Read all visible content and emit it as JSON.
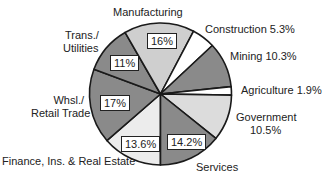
{
  "chart_data": {
    "type": "pie",
    "title": "",
    "start_angle_deg_clockwise_from_top": 180,
    "slices": [
      {
        "label": "Finance, Ins. & Real Estate",
        "value": 13.6,
        "display": "13.6%",
        "fill": "#ececec",
        "label_inside": true
      },
      {
        "label": "Whsl./ Retail Trade",
        "value": 17,
        "display": "17%",
        "fill": "#8a8a8a",
        "label_inside": true
      },
      {
        "label": "Trans./ Utilities",
        "value": 11,
        "display": "11%",
        "fill": "#8a8a8a",
        "label_inside": true
      },
      {
        "label": "Manufacturing",
        "value": 16,
        "display": "16%",
        "fill": "#cfcfcf",
        "label_inside": true
      },
      {
        "label": "Construction",
        "value": 5.3,
        "display": "5.3%",
        "fill": "#ffffff",
        "label_inside": false
      },
      {
        "label": "Mining",
        "value": 10.3,
        "display": "10.3%",
        "fill": "#8a8a8a",
        "label_inside": false
      },
      {
        "label": "Agriculture",
        "value": 1.9,
        "display": "1.9%",
        "fill": "#ffffff",
        "label_inside": false
      },
      {
        "label": "Government",
        "value": 10.5,
        "display": "10.5%",
        "fill": "#dcdcdc",
        "label_inside": false
      },
      {
        "label": "Services",
        "value": 14.2,
        "display": "14.2%",
        "fill": "#8a8a8a",
        "label_inside": true
      }
    ],
    "legend": "none (direct labels)"
  },
  "labels": {
    "manufacturing": "Manufacturing",
    "trans_line1": "Trans./",
    "trans_line2": "Utilities",
    "whsl_line1": "Whsl./",
    "whsl_line2": "Retail Trade",
    "finance": "Finance, Ins. & Real Estate",
    "services": "Services",
    "construction": "Construction  5.3%",
    "mining": "Mining  10.3%",
    "agriculture": "Agriculture  1.9%",
    "government_line1": "Government",
    "government_line2": "10.5%"
  },
  "boxes": {
    "manufacturing": "16%",
    "trans": "11%",
    "whsl": "17%",
    "finance": "13.6%",
    "services": "14.2%"
  },
  "geometry": {
    "cx": 160.5,
    "cy": 94,
    "r": 71
  },
  "stroke": "#1a1a1a"
}
